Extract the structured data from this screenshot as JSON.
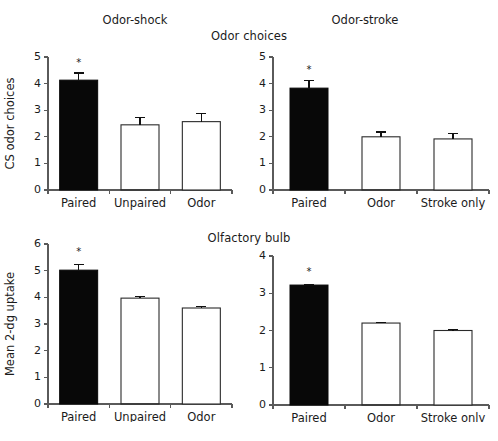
{
  "figure": {
    "group_titles": {
      "top": "Odor choices",
      "bottom": "Olfactory bulb"
    },
    "panel_titles": {
      "left": "Odor-shock",
      "right": "Odor-stroke"
    },
    "significance_marker": "*"
  },
  "chart_data": [
    {
      "id": "top-left",
      "type": "bar",
      "title": "Odor-shock",
      "group": "Odor choices",
      "xlabel": "",
      "ylabel": "CS odor choices",
      "ylim": [
        0,
        5
      ],
      "yticks": [
        0,
        1,
        2,
        3,
        4,
        5
      ],
      "ytick_labels": [
        "0",
        "1",
        "2",
        "3",
        "4",
        "5"
      ],
      "grid": false,
      "legend": "none",
      "categories": [
        "Paired",
        "Unpaired",
        "Odor"
      ],
      "values": [
        4.13,
        2.45,
        2.57
      ],
      "errors": [
        0.27,
        0.28,
        0.3
      ],
      "bar_styles": [
        "black",
        "gray-hatch",
        "white"
      ],
      "annotations": [
        {
          "category": "Paired",
          "text": "*",
          "value": 4.68
        }
      ]
    },
    {
      "id": "top-right",
      "type": "bar",
      "title": "Odor-stroke",
      "group": "Odor choices",
      "xlabel": "",
      "ylabel": "",
      "ylim": [
        0,
        5
      ],
      "yticks": [
        0,
        1,
        2,
        3,
        4,
        5
      ],
      "ytick_labels": [
        "0",
        "1",
        "2",
        "3",
        "4",
        "5"
      ],
      "grid": false,
      "legend": "none",
      "categories": [
        "Paired",
        "Odor",
        "Stroke only"
      ],
      "values": [
        3.83,
        2.0,
        1.92
      ],
      "errors": [
        0.27,
        0.18,
        0.22
      ],
      "bar_styles": [
        "black",
        "gray-hatch",
        "white"
      ],
      "annotations": [
        {
          "category": "Paired",
          "text": "*",
          "value": 4.4
        }
      ]
    },
    {
      "id": "bottom-left",
      "type": "bar",
      "title": "Odor-shock",
      "group": "Olfactory bulb",
      "xlabel": "",
      "ylabel": "Mean 2-dg uptake",
      "ylim": [
        0,
        6
      ],
      "yticks": [
        0,
        1,
        2,
        3,
        4,
        5,
        6
      ],
      "ytick_labels": [
        "0",
        "1",
        "2",
        "3",
        "4",
        "5",
        "6"
      ],
      "grid": false,
      "legend": "none",
      "categories": [
        "Paired",
        "Unpaired",
        "Odor"
      ],
      "values": [
        5.02,
        3.97,
        3.6
      ],
      "errors": [
        0.2,
        0.07,
        0.07
      ],
      "bar_styles": [
        "black",
        "gray-hatch",
        "white"
      ],
      "annotations": [
        {
          "category": "Paired",
          "text": "*",
          "value": 5.6
        }
      ]
    },
    {
      "id": "bottom-right",
      "type": "bar",
      "title": "Odor-stroke",
      "group": "Olfactory bulb",
      "xlabel": "",
      "ylabel": "",
      "ylim": [
        0,
        4
      ],
      "yticks": [
        0,
        1,
        2,
        3,
        4
      ],
      "ytick_labels": [
        "0",
        "1",
        "2",
        "3",
        "4"
      ],
      "grid": false,
      "legend": "none",
      "categories": [
        "Paired",
        "Odor",
        "Stroke only"
      ],
      "values": [
        3.22,
        2.2,
        2.0
      ],
      "errors": [
        0.02,
        0.02,
        0.02
      ],
      "bar_styles": [
        "black",
        "gray-hatch",
        "white"
      ],
      "annotations": [
        {
          "category": "Paired",
          "text": "*",
          "value": 3.5
        }
      ]
    }
  ],
  "colors": {
    "bar_black": "#080808",
    "bar_gray": "#dcdcdc",
    "bar_white": "#ffffff",
    "bar_outline": "#2a2a2a",
    "axis": "#5a5a5a",
    "text": "#1b1b1b",
    "background": "#ffffff"
  }
}
